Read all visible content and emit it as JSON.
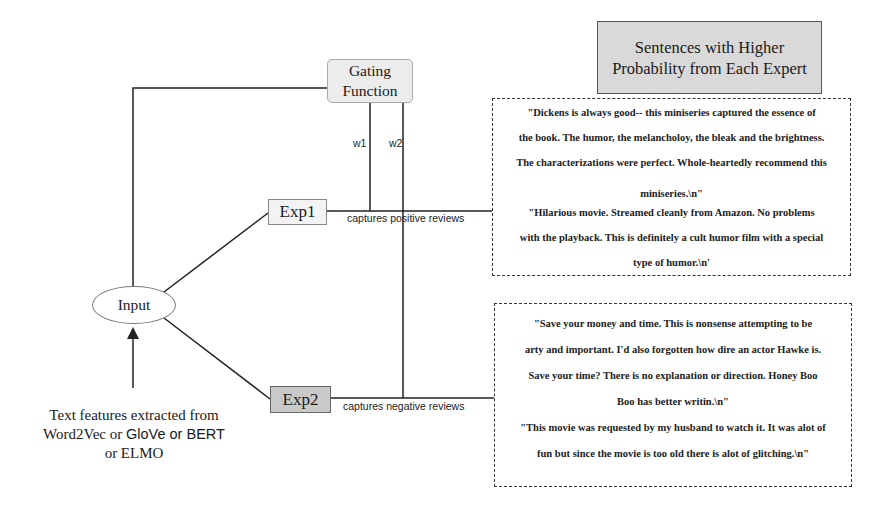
{
  "title": "Sentences with Higher Probability from Each Expert",
  "nodes": {
    "gating": "Gating Function",
    "input": "Input",
    "exp1": "Exp1",
    "exp2": "Exp2"
  },
  "weights": {
    "w1": "w1",
    "w2": "w2"
  },
  "edge_labels": {
    "exp1": "captures positive reviews",
    "exp2": "captures negative reviews"
  },
  "input_caption": {
    "line1": "Text features extracted from",
    "line2_a": "Word2Vec or ",
    "line2_b": "GloVe or BERT",
    "line3": "or ELMO"
  },
  "positive_reviews": {
    "lines": [
      "\"Dickens is always good-- this miniseries captured the essence of",
      "the book. The humor, the melancholoy, the bleak and the brightness.",
      "The characterizations were perfect. Whole-heartedly recommend this",
      "miniseries.\\n\"",
      "\"Hilarious movie. Streamed cleanly from Amazon. No problems",
      "with the playback. This is definitely a cult humor film with a special",
      "type of humor.\\n'"
    ]
  },
  "negative_reviews": {
    "lines": [
      "\"Save your money and time. This is nonsense attempting to be",
      "arty and important. I'd also forgotten how dire an actor Hawke is.",
      "Save your time? There is no explanation or direction. Honey Boo",
      "Boo has better writin.\\n\"",
      "\"This movie was requested by my husband to watch it. It was alot of",
      "fun but since the movie is too old there is alot of glitching.\\n\""
    ]
  },
  "colors": {
    "title_fill": "#d9d9d9",
    "gating_fill": "#ececec",
    "exp1_fill": "#f3f3f3",
    "exp2_fill": "#c9c9c9",
    "line": "#222222"
  }
}
